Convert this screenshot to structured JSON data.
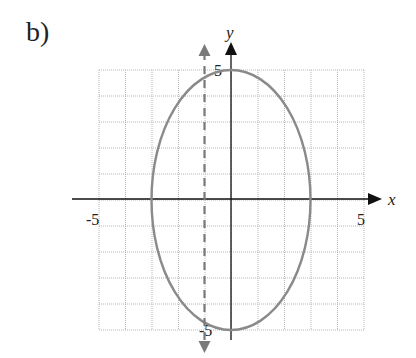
{
  "problem_label": "b)",
  "chart_data": {
    "type": "line",
    "title": "",
    "xlabel": "x",
    "ylabel": "y",
    "xlim": [
      -5,
      5
    ],
    "ylim": [
      -5,
      5
    ],
    "grid": true,
    "grid_step": 1,
    "tick_labels": {
      "x": [
        "-5",
        "5"
      ],
      "y": [
        "5",
        "-5"
      ]
    },
    "series": [
      {
        "name": "ellipse",
        "equation": "x^2/9 + y^2/25 = 1",
        "center": [
          0,
          0
        ],
        "semi_axis_x": 3,
        "semi_axis_y": 5,
        "color": "#8a8a8a",
        "style": "solid"
      },
      {
        "name": "vertical line",
        "equation": "x = -1",
        "color": "#8a8a8a",
        "style": "dashed",
        "arrows": "both"
      }
    ]
  }
}
